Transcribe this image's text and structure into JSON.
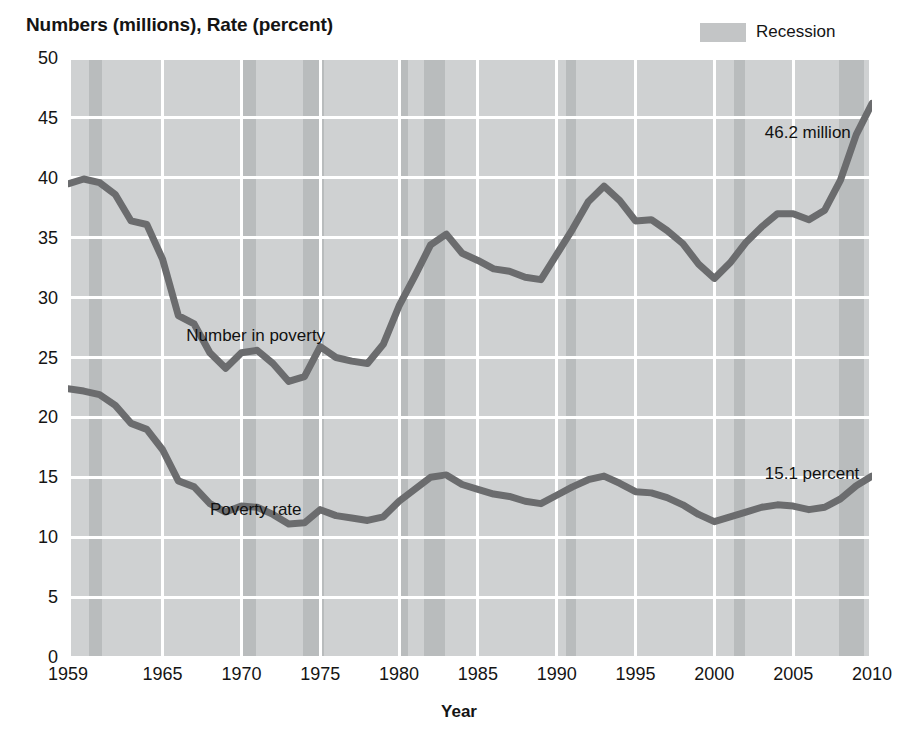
{
  "chart_title": "Numbers (millions), Rate (percent)",
  "legend": {
    "items": [
      {
        "label": "Recession",
        "color": "#b9bcbd"
      }
    ]
  },
  "axes": {
    "y": {
      "label": "Numbers (millions), Rate (percent)",
      "min": 0,
      "max": 50,
      "step": 5,
      "ticks": [
        "0",
        "5",
        "10",
        "15",
        "20",
        "25",
        "30",
        "35",
        "40",
        "45",
        "50"
      ]
    },
    "x": {
      "label": "Year",
      "min": 1959,
      "max": 2010,
      "ticks": [
        "1959",
        "1965",
        "1970",
        "1975",
        "1980",
        "1985",
        "1990",
        "1995",
        "2000",
        "2005",
        "2010"
      ]
    }
  },
  "annotations": [
    {
      "name": "number-in-poverty-label",
      "text": "Number in poverty",
      "x": 1966.5,
      "y": 27.6
    },
    {
      "name": "poverty-rate-label",
      "text": "Poverty rate",
      "x": 1968.0,
      "y": 13.1
    },
    {
      "name": "number-value-label",
      "text": "46.2 million",
      "x": 2003.2,
      "y": 44.6
    },
    {
      "name": "rate-value-label",
      "text": "15.1 percent",
      "x": 2003.2,
      "y": 16.1
    }
  ],
  "colors": {
    "plot_background": "#cfd1d2",
    "recession_band": "#b9bcbd",
    "gridline": "#ffffff",
    "series_line": "#6b6c6e",
    "text": "#141414"
  },
  "chart_data": {
    "type": "line",
    "title": "Numbers (millions), Rate (percent)",
    "xlabel": "Year",
    "ylabel": "Numbers (millions), Rate (percent)",
    "xlim": [
      1959,
      2010
    ],
    "ylim": [
      0,
      50
    ],
    "grid": true,
    "legend_position": "top-right",
    "x": [
      1959,
      1960,
      1961,
      1962,
      1963,
      1964,
      1965,
      1966,
      1967,
      1968,
      1969,
      1970,
      1971,
      1972,
      1973,
      1974,
      1975,
      1976,
      1977,
      1978,
      1979,
      1980,
      1981,
      1982,
      1983,
      1984,
      1985,
      1986,
      1987,
      1988,
      1989,
      1990,
      1991,
      1992,
      1993,
      1994,
      1995,
      1996,
      1997,
      1998,
      1999,
      2000,
      2001,
      2002,
      2003,
      2004,
      2005,
      2006,
      2007,
      2008,
      2009,
      2010
    ],
    "series": [
      {
        "name": "Number in poverty",
        "unit": "millions",
        "end_label": "46.2 million",
        "values": [
          39.5,
          39.9,
          39.6,
          38.6,
          36.4,
          36.1,
          33.2,
          28.5,
          27.8,
          25.4,
          24.1,
          25.4,
          25.6,
          24.5,
          23.0,
          23.4,
          25.9,
          25.0,
          24.7,
          24.5,
          26.1,
          29.3,
          31.8,
          34.4,
          35.3,
          33.7,
          33.1,
          32.4,
          32.2,
          31.7,
          31.5,
          33.6,
          35.7,
          38.0,
          39.3,
          38.1,
          36.4,
          36.5,
          35.6,
          34.5,
          32.8,
          31.6,
          32.9,
          34.6,
          35.9,
          37.0,
          37.0,
          36.5,
          37.3,
          39.8,
          43.6,
          46.2
        ]
      },
      {
        "name": "Poverty rate",
        "unit": "percent",
        "end_label": "15.1 percent",
        "values": [
          22.4,
          22.2,
          21.9,
          21.0,
          19.5,
          19.0,
          17.3,
          14.7,
          14.2,
          12.8,
          12.1,
          12.6,
          12.5,
          11.9,
          11.1,
          11.2,
          12.3,
          11.8,
          11.6,
          11.4,
          11.7,
          13.0,
          14.0,
          15.0,
          15.2,
          14.4,
          14.0,
          13.6,
          13.4,
          13.0,
          12.8,
          13.5,
          14.2,
          14.8,
          15.1,
          14.5,
          13.8,
          13.7,
          13.3,
          12.7,
          11.9,
          11.3,
          11.7,
          12.1,
          12.5,
          12.7,
          12.6,
          12.3,
          12.5,
          13.2,
          14.3,
          15.1
        ]
      }
    ],
    "recessions": [
      {
        "start": 1960.33,
        "end": 1961.17
      },
      {
        "start": 1969.92,
        "end": 1970.92
      },
      {
        "start": 1973.92,
        "end": 1975.25
      },
      {
        "start": 1980.08,
        "end": 1980.58
      },
      {
        "start": 1981.58,
        "end": 1982.92
      },
      {
        "start": 1990.58,
        "end": 1991.25
      },
      {
        "start": 2001.25,
        "end": 2001.92
      },
      {
        "start": 2007.92,
        "end": 2009.5
      }
    ]
  }
}
